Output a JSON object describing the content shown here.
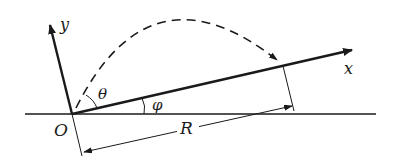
{
  "diagram": {
    "type": "projectile-on-inclined-plane",
    "labels": {
      "y_axis": "y",
      "x_axis": "x",
      "theta": "θ",
      "phi": "φ",
      "origin": "O",
      "range": "R"
    },
    "colors": {
      "stroke": "#1a1a1a",
      "background": "#ffffff"
    }
  }
}
